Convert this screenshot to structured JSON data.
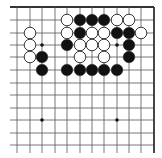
{
  "board": {
    "type": "go-diagram",
    "grid": {
      "columns_x": [
        17,
        30,
        42,
        55,
        67,
        80,
        92,
        104,
        117,
        129,
        141,
        154
      ],
      "rows_y": [
        7,
        20,
        33,
        45,
        57,
        70,
        83,
        95,
        108,
        120,
        133,
        145
      ],
      "edges": {
        "top": true,
        "right": true,
        "left": false,
        "bottom": false
      },
      "line_extent": {
        "left": 10,
        "bottom": 153
      }
    },
    "colors": {
      "line": "#555555",
      "edge": "#333333",
      "black_stone": "#111111",
      "white_stone": "#ffffff",
      "stone_outline": "#222222"
    },
    "hoshi": [
      {
        "col": 2,
        "row": 3
      },
      {
        "col": 8,
        "row": 3
      },
      {
        "col": 2,
        "row": 9
      },
      {
        "col": 8,
        "row": 9
      }
    ],
    "stones": [
      {
        "color": "white",
        "col": 4,
        "row": 1
      },
      {
        "color": "black",
        "col": 5,
        "row": 1
      },
      {
        "color": "black",
        "col": 6,
        "row": 1
      },
      {
        "color": "black",
        "col": 7,
        "row": 1
      },
      {
        "color": "white",
        "col": 8,
        "row": 1
      },
      {
        "color": "white",
        "col": 9,
        "row": 1
      },
      {
        "color": "white",
        "col": 1,
        "row": 2
      },
      {
        "color": "white",
        "col": 4,
        "row": 2
      },
      {
        "color": "black",
        "col": 5,
        "row": 2
      },
      {
        "color": "white",
        "col": 6,
        "row": 2
      },
      {
        "color": "white",
        "col": 7,
        "row": 2
      },
      {
        "color": "black",
        "col": 8,
        "row": 2
      },
      {
        "color": "black",
        "col": 9,
        "row": 2
      },
      {
        "color": "white",
        "col": 10,
        "row": 2
      },
      {
        "color": "white",
        "col": 1,
        "row": 3
      },
      {
        "color": "black",
        "col": 4,
        "row": 3
      },
      {
        "color": "white",
        "col": 5,
        "row": 3
      },
      {
        "color": "white",
        "col": 6,
        "row": 3
      },
      {
        "color": "white",
        "col": 7,
        "row": 3
      },
      {
        "color": "black",
        "col": 9,
        "row": 3
      },
      {
        "color": "white",
        "col": 1,
        "row": 4
      },
      {
        "color": "black",
        "col": 2,
        "row": 4
      },
      {
        "color": "white",
        "col": 5,
        "row": 4
      },
      {
        "color": "white",
        "col": 7,
        "row": 4
      },
      {
        "color": "black",
        "col": 9,
        "row": 4
      },
      {
        "color": "black",
        "col": 2,
        "row": 5
      },
      {
        "color": "black",
        "col": 4,
        "row": 5
      },
      {
        "color": "black",
        "col": 5,
        "row": 5
      },
      {
        "color": "black",
        "col": 6,
        "row": 5
      },
      {
        "color": "black",
        "col": 7,
        "row": 5
      },
      {
        "color": "black",
        "col": 8,
        "row": 5
      }
    ],
    "stone_radius": 5.8
  }
}
